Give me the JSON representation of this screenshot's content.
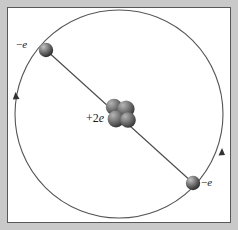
{
  "figure": {
    "background_color": "#c9c9c9",
    "panel_color": "#ffffff",
    "frame_color": "#585858",
    "stroke_color": "#4a4a4a"
  },
  "orbit": {
    "name": "electron-orbit",
    "center_x": 111,
    "center_y": 106,
    "radius": 104,
    "stroke_color": "#555555",
    "stroke_width": 1,
    "direction": "counterclockwise",
    "arrow_count": 2
  },
  "axis_line": {
    "name": "diameter-line",
    "x1": 38,
    "y1": 42,
    "x2": 185,
    "y2": 175,
    "stroke_color": "#4a4a4a",
    "stroke_width": 1
  },
  "nucleus": {
    "label": "+2e",
    "label_prefix": "+2",
    "label_symbol": "e",
    "charge": "+2e",
    "nucleon_count": 4,
    "center_x": 111,
    "center_y": 106,
    "color_light": "#8c8c8c",
    "color_dark": "#3d3d3d"
  },
  "electrons": [
    {
      "name": "electron-upper-left",
      "label": "−e",
      "label_prefix": "−",
      "label_symbol": "e",
      "charge": "-e",
      "x": 38,
      "y": 42,
      "radius": 7,
      "color_light": "#9a9a9a",
      "color_dark": "#2f2f2f"
    },
    {
      "name": "electron-lower-right",
      "label": "−e",
      "label_prefix": "−",
      "label_symbol": "e",
      "charge": "-e",
      "x": 185,
      "y": 175,
      "radius": 7,
      "color_light": "#9a9a9a",
      "color_dark": "#2f2f2f"
    }
  ],
  "arrows": [
    {
      "name": "orbit-arrow-left",
      "x": 7,
      "y": 90,
      "direction": "down"
    },
    {
      "name": "orbit-arrow-right",
      "x": 206,
      "y": 148,
      "direction": "up"
    }
  ]
}
